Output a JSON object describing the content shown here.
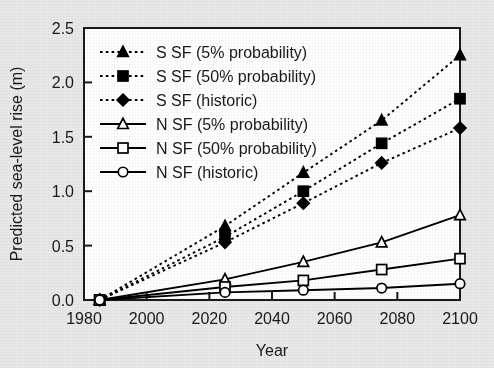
{
  "chart_data": {
    "type": "line",
    "title": "",
    "xlabel": "Year",
    "ylabel": "Predicted sea-level rise (m)",
    "xlim": [
      1980,
      2100
    ],
    "ylim": [
      0.0,
      2.5
    ],
    "xticks": [
      1980,
      2000,
      2020,
      2040,
      2060,
      2080,
      2100
    ],
    "xticklabels": [
      "1980",
      "2000",
      "2020",
      "2040",
      "2060",
      "2080",
      "2100"
    ],
    "yticks": [
      0.0,
      0.5,
      1.0,
      1.5,
      2.0,
      2.5
    ],
    "yticklabels": [
      "0.0",
      "0.5",
      "1.0",
      "1.5",
      "2.0",
      "2.5"
    ],
    "grid": false,
    "legend_position": "upper left",
    "x": [
      1985,
      2025,
      2050,
      2075,
      2100
    ],
    "series": [
      {
        "name": "S SF (5% probability)",
        "values": [
          0.0,
          0.68,
          1.17,
          1.65,
          2.25
        ],
        "marker": "triangle-filled",
        "linestyle": "dotted",
        "color": "#000000"
      },
      {
        "name": "S SF (50% probability)",
        "values": [
          0.0,
          0.58,
          1.0,
          1.44,
          1.85
        ],
        "marker": "square-filled",
        "linestyle": "dotted",
        "color": "#000000"
      },
      {
        "name": "S SF (historic)",
        "values": [
          0.0,
          0.53,
          0.89,
          1.26,
          1.58
        ],
        "marker": "diamond-filled",
        "linestyle": "dotted",
        "color": "#000000"
      },
      {
        "name": "N SF (5% probability)",
        "values": [
          0.0,
          0.19,
          0.35,
          0.53,
          0.78
        ],
        "marker": "triangle-open",
        "linestyle": "solid",
        "color": "#000000"
      },
      {
        "name": "N SF (50% probability)",
        "values": [
          0.0,
          0.12,
          0.18,
          0.28,
          0.38
        ],
        "marker": "square-open",
        "linestyle": "solid",
        "color": "#000000"
      },
      {
        "name": "N SF (historic)",
        "values": [
          0.0,
          0.07,
          0.09,
          0.11,
          0.15
        ],
        "marker": "circle-open",
        "linestyle": "solid",
        "color": "#000000"
      }
    ]
  },
  "legend": {
    "entries": [
      "S SF (5% probability)",
      "S SF (50% probability)",
      "S SF (historic)",
      "N SF (5% probability)",
      "N SF (50% probability)",
      "N SF (historic)"
    ]
  },
  "axes": {
    "x_title": "Year",
    "y_title": "Predicted sea-level rise (m)"
  },
  "style": {
    "page_background": "#e9e9e7",
    "plot_background": "#ffffff",
    "ink": "#1a1a1a"
  }
}
